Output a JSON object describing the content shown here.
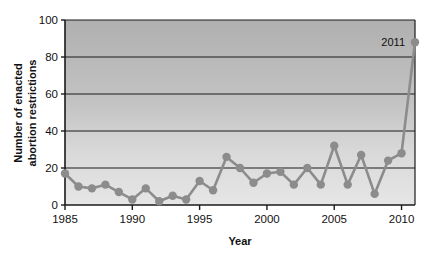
{
  "chart_data": {
    "type": "line",
    "title": "",
    "xlabel": "Year",
    "ylabel": "Number of enacted abortion restrictions",
    "ylabel_line1": "Number of enacted",
    "ylabel_line2": "abortion restrictions",
    "xlim": [
      1985,
      2011
    ],
    "ylim": [
      0,
      100
    ],
    "grid": true,
    "grid_axis": "y",
    "legend": "none",
    "x": [
      1985,
      1986,
      1987,
      1988,
      1989,
      1990,
      1991,
      1992,
      1993,
      1994,
      1995,
      1996,
      1997,
      1998,
      1999,
      2000,
      2001,
      2002,
      2003,
      2004,
      2005,
      2006,
      2007,
      2008,
      2009,
      2010,
      2011
    ],
    "values": [
      17,
      10,
      9,
      11,
      7,
      3,
      9,
      2,
      5,
      3,
      13,
      8,
      26,
      20,
      12,
      17,
      18,
      11,
      20,
      11,
      32,
      11,
      27,
      6,
      24,
      28,
      88
    ],
    "series": [
      {
        "name": "Enacted abortion restrictions",
        "values": [
          17,
          10,
          9,
          11,
          7,
          3,
          9,
          2,
          5,
          3,
          13,
          8,
          26,
          20,
          12,
          17,
          18,
          11,
          20,
          11,
          32,
          11,
          27,
          6,
          24,
          28,
          88
        ]
      }
    ],
    "xticks": [
      1985,
      1990,
      1995,
      2000,
      2005,
      2010
    ],
    "xtick_labels": [
      "1985",
      "1990",
      "1995",
      "2000",
      "2005",
      "2010"
    ],
    "yticks": [
      0,
      20,
      40,
      60,
      80,
      100
    ],
    "ytick_labels": [
      "0",
      "20",
      "40",
      "60",
      "80",
      "100"
    ],
    "annotations": [
      {
        "text": "2011",
        "x": 2011,
        "y": 88,
        "position": "left-of-point"
      }
    ],
    "colors": {
      "line": "#8c8c8c",
      "marker": "#8c8c8c",
      "gridline": "#1a1a1a",
      "axis": "#1a1a1a",
      "plot_background_top": "#b3b3b3",
      "plot_background_bottom": "#e2e2e2",
      "figure_background": "#ffffff",
      "text": "#111111"
    }
  }
}
